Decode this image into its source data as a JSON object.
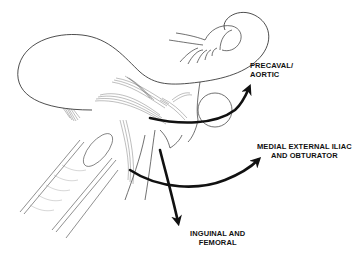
{
  "figure": {
    "type": "anatomical illustration",
    "line_color": "#111111",
    "background": "#ffffff"
  },
  "labels": {
    "precaval": {
      "line1": "PRECAVAL/",
      "line2": "AORTIC"
    },
    "iliac": {
      "line1": "MEDIAL EXTERNAL ILIAC",
      "line2": "AND OBTURATOR"
    },
    "inguinal": {
      "line1": "INGUINAL AND",
      "line2": "FEMORAL"
    }
  },
  "arrows": [
    {
      "name": "precaval-aortic-arrow",
      "direction": "up-right"
    },
    {
      "name": "medial-external-iliac-arrow",
      "direction": "right"
    },
    {
      "name": "inguinal-femoral-arrow",
      "direction": "down"
    }
  ]
}
